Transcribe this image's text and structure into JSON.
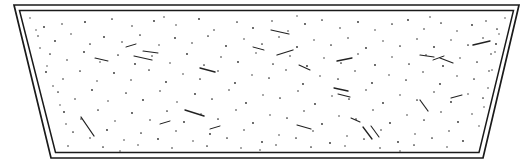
{
  "figure": {
    "kind": "technical-line-drawing",
    "title": "",
    "caption": "",
    "canvas": {
      "width": 525,
      "height": 168,
      "background": "#ffffff"
    },
    "colors": {
      "background": "#ffffff",
      "outline": "#1a1a1a",
      "speckle": "#2b2b2b",
      "dash": "#222222"
    },
    "outline": {
      "style": "double-line",
      "stroke_width_outer": 1.7,
      "stroke_width_inner": 1.5,
      "gap": 5,
      "outer_points": "14,5 519,5 483,158 51,158",
      "inner_points": "19.5,10.5 513.5,10.5 479,152.5 55.5,152.5",
      "corners": {
        "top_left": [
          14,
          5
        ],
        "top_right": [
          519,
          5
        ],
        "bottom_right": [
          483,
          158
        ],
        "bottom_left": [
          51,
          158
        ]
      }
    },
    "fill": {
      "pattern": "stipple",
      "description": "scattered fine dots with occasional short dashes",
      "dot_count": 206,
      "dash_count": 26
    },
    "speckles": {
      "dots": [
        [
          44,
          27,
          0.9
        ],
        [
          62,
          24,
          0.8
        ],
        [
          85,
          22,
          0.95
        ],
        [
          112,
          19,
          0.85
        ],
        [
          132,
          26,
          0.8
        ],
        [
          154,
          21,
          0.9
        ],
        [
          176,
          25,
          0.75
        ],
        [
          199,
          19,
          0.9
        ],
        [
          214,
          30,
          0.8
        ],
        [
          237,
          22,
          0.85
        ],
        [
          253,
          28,
          0.9
        ],
        [
          272,
          21,
          0.8
        ],
        [
          288,
          31,
          0.75
        ],
        [
          305,
          24,
          0.9
        ],
        [
          322,
          20,
          0.85
        ],
        [
          340,
          28,
          0.8
        ],
        [
          358,
          22,
          0.9
        ],
        [
          375,
          30,
          0.75
        ],
        [
          392,
          24,
          0.85
        ],
        [
          408,
          20,
          0.9
        ],
        [
          424,
          29,
          0.8
        ],
        [
          441,
          23,
          0.85
        ],
        [
          457,
          31,
          0.75
        ],
        [
          472,
          25,
          0.9
        ],
        [
          486,
          21,
          0.8
        ],
        [
          497,
          29,
          0.85
        ],
        [
          38,
          36,
          0.8
        ],
        [
          55,
          41,
          0.9
        ],
        [
          71,
          34,
          0.75
        ],
        [
          90,
          44,
          0.85
        ],
        [
          104,
          37,
          0.9
        ],
        [
          122,
          42,
          0.8
        ],
        [
          140,
          35,
          0.85
        ],
        [
          159,
          45,
          0.75
        ],
        [
          175,
          38,
          0.9
        ],
        [
          192,
          43,
          0.8
        ],
        [
          208,
          36,
          0.85
        ],
        [
          226,
          46,
          0.9
        ],
        [
          244,
          39,
          0.75
        ],
        [
          262,
          44,
          0.85
        ],
        [
          279,
          37,
          0.8
        ],
        [
          297,
          47,
          0.9
        ],
        [
          314,
          40,
          0.75
        ],
        [
          331,
          45,
          0.85
        ],
        [
          348,
          38,
          0.8
        ],
        [
          366,
          48,
          0.9
        ],
        [
          383,
          41,
          0.75
        ],
        [
          400,
          46,
          0.85
        ],
        [
          417,
          39,
          0.8
        ],
        [
          434,
          47,
          0.9
        ],
        [
          451,
          40,
          0.75
        ],
        [
          468,
          45,
          0.85
        ],
        [
          483,
          38,
          0.8
        ],
        [
          496,
          44,
          0.9
        ],
        [
          50,
          54,
          0.85
        ],
        [
          67,
          60,
          0.8
        ],
        [
          84,
          52,
          0.9
        ],
        [
          100,
          62,
          0.75
        ],
        [
          118,
          55,
          0.85
        ],
        [
          135,
          64,
          0.9
        ],
        [
          152,
          56,
          0.8
        ],
        [
          170,
          63,
          0.75
        ],
        [
          187,
          54,
          0.9
        ],
        [
          204,
          65,
          0.85
        ],
        [
          221,
          57,
          0.8
        ],
        [
          238,
          62,
          0.9
        ],
        [
          256,
          53,
          0.75
        ],
        [
          273,
          64,
          0.85
        ],
        [
          290,
          56,
          0.8
        ],
        [
          307,
          66,
          0.9
        ],
        [
          324,
          58,
          0.75
        ],
        [
          341,
          63,
          0.85
        ],
        [
          358,
          54,
          0.8
        ],
        [
          375,
          65,
          0.9
        ],
        [
          392,
          57,
          0.75
        ],
        [
          409,
          64,
          0.85
        ],
        [
          426,
          55,
          0.8
        ],
        [
          443,
          66,
          0.9
        ],
        [
          460,
          58,
          0.75
        ],
        [
          477,
          62,
          0.85
        ],
        [
          491,
          54,
          0.8
        ],
        [
          46,
          72,
          0.9
        ],
        [
          63,
          79,
          0.8
        ],
        [
          80,
          71,
          0.85
        ],
        [
          97,
          81,
          0.75
        ],
        [
          114,
          73,
          0.9
        ],
        [
          131,
          80,
          0.8
        ],
        [
          149,
          70,
          0.85
        ],
        [
          166,
          82,
          0.9
        ],
        [
          183,
          74,
          0.75
        ],
        [
          200,
          79,
          0.85
        ],
        [
          218,
          71,
          0.8
        ],
        [
          235,
          83,
          0.9
        ],
        [
          252,
          75,
          0.75
        ],
        [
          269,
          78,
          0.85
        ],
        [
          286,
          70,
          0.8
        ],
        [
          303,
          84,
          0.9
        ],
        [
          320,
          76,
          0.75
        ],
        [
          338,
          79,
          0.85
        ],
        [
          355,
          71,
          0.8
        ],
        [
          372,
          83,
          0.9
        ],
        [
          389,
          75,
          0.75
        ],
        [
          406,
          80,
          0.85
        ],
        [
          423,
          72,
          0.8
        ],
        [
          440,
          84,
          0.9
        ],
        [
          457,
          76,
          0.75
        ],
        [
          474,
          79,
          0.85
        ],
        [
          489,
          71,
          0.8
        ],
        [
          58,
          92,
          0.85
        ],
        [
          75,
          99,
          0.8
        ],
        [
          92,
          90,
          0.9
        ],
        [
          108,
          101,
          0.75
        ],
        [
          126,
          93,
          0.85
        ],
        [
          143,
          100,
          0.9
        ],
        [
          160,
          91,
          0.8
        ],
        [
          177,
          102,
          0.75
        ],
        [
          195,
          94,
          0.9
        ],
        [
          212,
          99,
          0.85
        ],
        [
          229,
          90,
          0.8
        ],
        [
          246,
          103,
          0.9
        ],
        [
          263,
          95,
          0.75
        ],
        [
          280,
          98,
          0.85
        ],
        [
          298,
          91,
          0.8
        ],
        [
          315,
          104,
          0.9
        ],
        [
          332,
          96,
          0.75
        ],
        [
          349,
          99,
          0.85
        ],
        [
          366,
          90,
          0.8
        ],
        [
          383,
          103,
          0.9
        ],
        [
          400,
          95,
          0.75
        ],
        [
          417,
          100,
          0.85
        ],
        [
          434,
          92,
          0.8
        ],
        [
          451,
          102,
          0.9
        ],
        [
          468,
          94,
          0.75
        ],
        [
          483,
          98,
          0.85
        ],
        [
          64,
          112,
          0.9
        ],
        [
          81,
          119,
          0.8
        ],
        [
          98,
          110,
          0.85
        ],
        [
          115,
          121,
          0.75
        ],
        [
          132,
          113,
          0.9
        ],
        [
          150,
          120,
          0.8
        ],
        [
          167,
          111,
          0.85
        ],
        [
          184,
          122,
          0.9
        ],
        [
          201,
          114,
          0.75
        ],
        [
          218,
          119,
          0.85
        ],
        [
          236,
          110,
          0.8
        ],
        [
          253,
          123,
          0.9
        ],
        [
          270,
          115,
          0.75
        ],
        [
          287,
          118,
          0.85
        ],
        [
          304,
          111,
          0.8
        ],
        [
          322,
          124,
          0.9
        ],
        [
          339,
          116,
          0.75
        ],
        [
          356,
          119,
          0.85
        ],
        [
          373,
          110,
          0.8
        ],
        [
          390,
          123,
          0.9
        ],
        [
          407,
          115,
          0.75
        ],
        [
          424,
          120,
          0.85
        ],
        [
          441,
          112,
          0.8
        ],
        [
          458,
          122,
          0.9
        ],
        [
          472,
          114,
          0.75
        ],
        [
          73,
          132,
          0.85
        ],
        [
          90,
          138,
          0.8
        ],
        [
          107,
          130,
          0.9
        ],
        [
          124,
          140,
          0.75
        ],
        [
          141,
          133,
          0.85
        ],
        [
          158,
          139,
          0.9
        ],
        [
          176,
          131,
          0.8
        ],
        [
          193,
          141,
          0.75
        ],
        [
          210,
          134,
          0.9
        ],
        [
          227,
          138,
          0.85
        ],
        [
          244,
          130,
          0.8
        ],
        [
          262,
          142,
          0.9
        ],
        [
          279,
          135,
          0.75
        ],
        [
          296,
          138,
          0.85
        ],
        [
          313,
          131,
          0.8
        ],
        [
          330,
          143,
          0.9
        ],
        [
          347,
          136,
          0.75
        ],
        [
          364,
          139,
          0.85
        ],
        [
          381,
          130,
          0.8
        ],
        [
          398,
          142,
          0.9
        ],
        [
          415,
          134,
          0.75
        ],
        [
          432,
          138,
          0.85
        ],
        [
          449,
          131,
          0.8
        ],
        [
          463,
          141,
          0.9
        ],
        [
          68,
          146,
          0.8
        ],
        [
          103,
          147,
          0.85
        ],
        [
          138,
          145,
          0.75
        ],
        [
          172,
          148,
          0.8
        ],
        [
          207,
          146,
          0.85
        ],
        [
          241,
          148,
          0.75
        ],
        [
          276,
          145,
          0.8
        ],
        [
          311,
          147,
          0.85
        ],
        [
          345,
          146,
          0.75
        ],
        [
          380,
          148,
          0.8
        ],
        [
          414,
          145,
          0.85
        ],
        [
          447,
          147,
          0.75
        ],
        [
          36,
          30,
          0.7
        ],
        [
          40,
          48,
          0.75
        ],
        [
          47,
          66,
          0.7
        ],
        [
          53,
          86,
          0.75
        ],
        [
          60,
          105,
          0.7
        ],
        [
          66,
          124,
          0.75
        ],
        [
          499,
          34,
          0.7
        ],
        [
          495,
          52,
          0.75
        ],
        [
          492,
          70,
          0.7
        ],
        [
          488,
          88,
          0.75
        ],
        [
          484,
          107,
          0.7
        ],
        [
          479,
          126,
          0.7
        ],
        [
          30,
          18,
          0.7
        ],
        [
          505,
          18,
          0.7
        ],
        [
          164,
          17,
          0.75
        ],
        [
          297,
          16,
          0.7
        ],
        [
          430,
          17,
          0.75
        ],
        [
          120,
          151,
          0.7
        ],
        [
          260,
          150,
          0.75
        ],
        [
          400,
          151,
          0.7
        ]
      ],
      "dashes": [
        [
          277,
          55,
          293,
          50,
          1.3
        ],
        [
          134,
          56,
          152,
          60,
          1.2
        ],
        [
          200,
          68,
          215,
          72,
          1.4
        ],
        [
          271,
          30,
          289,
          34,
          1.2
        ],
        [
          143,
          51,
          158,
          53,
          1.1
        ],
        [
          337,
          61,
          352,
          58,
          1.3
        ],
        [
          473,
          45,
          490,
          41,
          1.4
        ],
        [
          440,
          58,
          453,
          63,
          1.2
        ],
        [
          334,
          88,
          348,
          91,
          1.3
        ],
        [
          338,
          94,
          350,
          97,
          1.1
        ],
        [
          185,
          110,
          204,
          116,
          1.4
        ],
        [
          81,
          117,
          94,
          136,
          1.3
        ],
        [
          297,
          125,
          311,
          129,
          1.2
        ],
        [
          363,
          127,
          372,
          139,
          1.3
        ],
        [
          371,
          126,
          379,
          137,
          1.1
        ],
        [
          420,
          100,
          428,
          111,
          1.2
        ],
        [
          351,
          118,
          360,
          122,
          1.1
        ],
        [
          253,
          47,
          264,
          50,
          1.0
        ],
        [
          95,
          58,
          108,
          61,
          1.1
        ],
        [
          420,
          55,
          434,
          57,
          1.2
        ],
        [
          433,
          60,
          444,
          56,
          1.0
        ],
        [
          299,
          65,
          310,
          70,
          1.1
        ],
        [
          126,
          47,
          136,
          44,
          1.0
        ],
        [
          451,
          98,
          462,
          95,
          1.1
        ],
        [
          210,
          129,
          220,
          126,
          1.0
        ],
        [
          160,
          124,
          170,
          121,
          1.0
        ]
      ]
    }
  }
}
